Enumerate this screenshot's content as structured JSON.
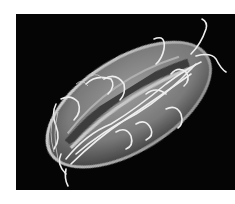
{
  "image": {
    "subject": "scanning electron micrograph of a flagellated microorganism",
    "background_color": "#050505",
    "page_color": "#ffffff"
  }
}
